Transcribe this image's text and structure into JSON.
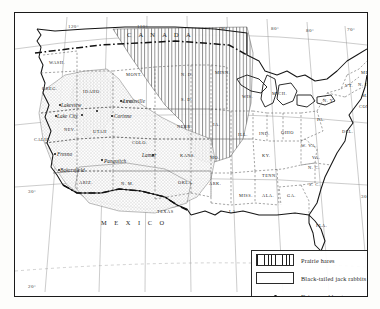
{
  "figure": {
    "kind": "distribution-map",
    "region": "United States",
    "background_color": "#ffffff",
    "ink_color": "#1a1a1a"
  },
  "legend": {
    "items": [
      {
        "symbol": "vertical-hatch-swatch",
        "label": "Prairie hares"
      },
      {
        "symbol": "stipple-swatch",
        "label": "Black-tailed jack rabbits"
      },
      {
        "symbol": "dot-symbol",
        "label": "Drives and hunts"
      }
    ]
  },
  "countries": [
    {
      "name": "CANADA",
      "letters": "C  A  N  A  D  A",
      "x": 120,
      "y": 22
    },
    {
      "name": "MEXICO",
      "letters": "M  E  X  I  C  O",
      "x": 96,
      "y": 212
    }
  ],
  "states": [
    {
      "abbr": "WASH.",
      "x": 40,
      "y": 50
    },
    {
      "abbr": "OREG.",
      "x": 33,
      "y": 76
    },
    {
      "abbr": "IDAHO",
      "x": 74,
      "y": 79
    },
    {
      "abbr": "MONT.",
      "x": 117,
      "y": 62
    },
    {
      "abbr": "N. D.",
      "x": 172,
      "y": 62
    },
    {
      "abbr": "S. D.",
      "x": 172,
      "y": 87
    },
    {
      "abbr": "MINN.",
      "x": 206,
      "y": 60
    },
    {
      "abbr": "WIS.",
      "x": 233,
      "y": 84
    },
    {
      "abbr": "MICH.",
      "x": 263,
      "y": 81
    },
    {
      "abbr": "WYO.",
      "x": 112,
      "y": 89
    },
    {
      "abbr": "NEV.",
      "x": 55,
      "y": 117
    },
    {
      "abbr": "UTAH",
      "x": 84,
      "y": 119
    },
    {
      "abbr": "COLO.",
      "x": 123,
      "y": 130
    },
    {
      "abbr": "NEBR.",
      "x": 168,
      "y": 114
    },
    {
      "abbr": "KANS.",
      "x": 171,
      "y": 143
    },
    {
      "abbr": "IA.",
      "x": 204,
      "y": 112
    },
    {
      "abbr": "MO.",
      "x": 201,
      "y": 145
    },
    {
      "abbr": "ILL.",
      "x": 229,
      "y": 122
    },
    {
      "abbr": "IND.",
      "x": 250,
      "y": 121
    },
    {
      "abbr": "OHIO",
      "x": 272,
      "y": 120
    },
    {
      "abbr": "KY.",
      "x": 253,
      "y": 143
    },
    {
      "abbr": "W. VA.",
      "x": 292,
      "y": 133
    },
    {
      "abbr": "VA.",
      "x": 303,
      "y": 145
    },
    {
      "abbr": "PA.",
      "x": 308,
      "y": 107
    },
    {
      "abbr": "N. Y.",
      "x": 314,
      "y": 88
    },
    {
      "abbr": "VT.",
      "x": 336,
      "y": 73
    },
    {
      "abbr": "N. H.",
      "x": 349,
      "y": 72
    },
    {
      "abbr": "ME.",
      "x": 352,
      "y": 60
    },
    {
      "abbr": "MASS.",
      "x": 353,
      "y": 83
    },
    {
      "abbr": "CONN.",
      "x": 350,
      "y": 94
    },
    {
      "abbr": "DEL.",
      "x": 333,
      "y": 119
    },
    {
      "abbr": "CALIF.",
      "x": 25,
      "y": 127
    },
    {
      "abbr": "ARIZ.",
      "x": 70,
      "y": 170
    },
    {
      "abbr": "N. M.",
      "x": 112,
      "y": 171
    },
    {
      "abbr": "OKLA.",
      "x": 169,
      "y": 170
    },
    {
      "abbr": "ARK.",
      "x": 200,
      "y": 171
    },
    {
      "abbr": "TENN.",
      "x": 253,
      "y": 163
    },
    {
      "abbr": "N. C.",
      "x": 299,
      "y": 155
    },
    {
      "abbr": "S. C.",
      "x": 300,
      "y": 172
    },
    {
      "abbr": "MISS.",
      "x": 230,
      "y": 183
    },
    {
      "abbr": "ALA.",
      "x": 253,
      "y": 183
    },
    {
      "abbr": "GA.",
      "x": 278,
      "y": 183
    },
    {
      "abbr": "LA.",
      "x": 220,
      "y": 199
    },
    {
      "abbr": "TEXAS",
      "x": 148,
      "y": 199
    },
    {
      "abbr": "FLA.",
      "x": 307,
      "y": 213
    }
  ],
  "cities": [
    {
      "name": "Lakeview",
      "x": 44,
      "y": 92
    },
    {
      "name": "Lake City",
      "x": 40,
      "y": 103
    },
    {
      "name": "Lewisville",
      "x": 106,
      "y": 88
    },
    {
      "name": "Corinne",
      "x": 97,
      "y": 103
    },
    {
      "name": "Fresno",
      "x": 40,
      "y": 141
    },
    {
      "name": "Panguitch",
      "x": 87,
      "y": 148
    },
    {
      "name": "Lamar",
      "x": 125,
      "y": 142
    },
    {
      "name": "Bakersfield",
      "x": 43,
      "y": 157
    }
  ],
  "hunt_dots": [
    {
      "x": 43.5,
      "y": 90.5
    },
    {
      "x": 39.5,
      "y": 101.5
    },
    {
      "x": 104.5,
      "y": 86.5
    },
    {
      "x": 95.5,
      "y": 101.5
    },
    {
      "x": 39.0,
      "y": 139.5
    },
    {
      "x": 86.0,
      "y": 146.0
    },
    {
      "x": 137.0,
      "y": 141.0
    },
    {
      "x": 42.5,
      "y": 155.5
    },
    {
      "x": 66.0,
      "y": 100.5
    },
    {
      "x": 81.0,
      "y": 97.0
    }
  ],
  "coordinates": {
    "top": [
      {
        "label": "120°",
        "x": 59,
        "y": 17
      },
      {
        "label": "110°",
        "x": 128,
        "y": 17
      },
      {
        "label": "90°",
        "x": 211,
        "y": 19
      },
      {
        "label": "80°",
        "x": 262,
        "y": 19
      },
      {
        "label": "80°",
        "x": 297,
        "y": 21
      },
      {
        "label": "70°",
        "x": 338,
        "y": 20
      }
    ],
    "bottom": [
      {
        "label": "110°",
        "x": 98,
        "y": 295
      },
      {
        "label": "100°",
        "x": 179,
        "y": 295
      },
      {
        "label": "90°",
        "x": 259,
        "y": 295
      },
      {
        "label": "80°",
        "x": 338,
        "y": 295
      }
    ],
    "left": [
      {
        "label": "30°",
        "x": 19,
        "y": 182
      },
      {
        "label": "20°",
        "x": 19,
        "y": 277
      }
    ],
    "right": [
      {
        "label": "30°",
        "x": 352,
        "y": 187
      }
    ]
  }
}
